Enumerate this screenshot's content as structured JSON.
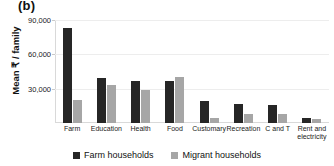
{
  "panel": {
    "label": "(b)"
  },
  "chart_data": {
    "type": "bar",
    "title": "(b)",
    "xlabel": "",
    "ylabel": "Mean ₹ / family",
    "ylim": [
      0,
      90000
    ],
    "yticks": [
      "30,000",
      "60,000",
      "90,000"
    ],
    "ytick_values": [
      30000,
      60000,
      90000
    ],
    "grid": true,
    "legend_position": "bottom",
    "categories": [
      "Farm",
      "Education",
      "Health",
      "Food",
      "Customary",
      "Recreation",
      "C and T",
      "Rent and electricity"
    ],
    "series": [
      {
        "name": "Farm households",
        "color": "#262626",
        "values": [
          83000,
          39000,
          37000,
          36500,
          19500,
          16500,
          15500,
          4000
        ]
      },
      {
        "name": "Migrant households",
        "color": "#a6a6a6",
        "values": [
          20500,
          33000,
          29000,
          40000,
          4500,
          8000,
          7500,
          3500
        ]
      }
    ]
  },
  "legend": {
    "items": [
      {
        "label": "Farm households",
        "color": "#262626"
      },
      {
        "label": "Migrant households",
        "color": "#a6a6a6"
      }
    ]
  }
}
